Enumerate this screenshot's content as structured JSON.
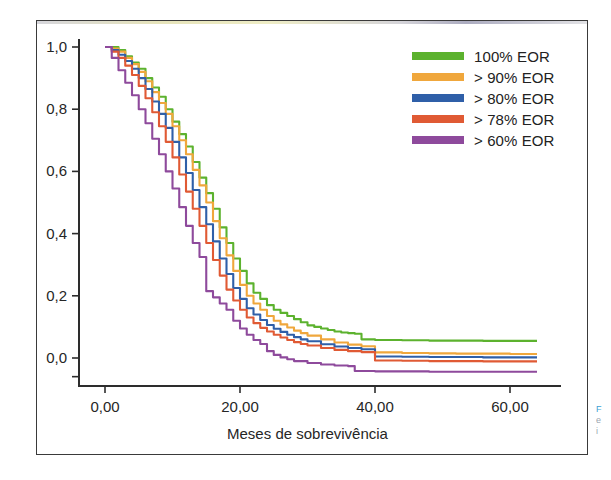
{
  "figure": {
    "background_color": "#ffffff",
    "frame_color": "#3a3a3a"
  },
  "legend": {
    "position": "top-right",
    "entries": [
      {
        "label": "100% EOR",
        "color": "#5cb22e"
      },
      {
        "label": "> 90% EOR",
        "color": "#f0a73c"
      },
      {
        "label": "> 80% EOR",
        "color": "#2f5fa8"
      },
      {
        "label": "> 78% EOR",
        "color": "#e05a34"
      },
      {
        "label": "> 60% EOR",
        "color": "#8e4a9c"
      }
    ]
  },
  "caption_fragment": {
    "line1": "F",
    "line2": "e",
    "line3": "i"
  },
  "chart_data": {
    "type": "line",
    "title": "",
    "subtitle": "",
    "xlabel": "Meses de sobrevivência",
    "ylabel": "",
    "xlim": [
      -4,
      68
    ],
    "ylim": [
      -0.09,
      1.06
    ],
    "grid": false,
    "legend_position": "top-right",
    "xticks": [
      0,
      20,
      40,
      60
    ],
    "xticklabels": [
      "0,00",
      "20,00",
      "40,00",
      "60,00"
    ],
    "yticks": [
      0.0,
      0.2,
      0.4,
      0.6,
      0.8,
      1.0
    ],
    "yticklabels": [
      "0,0",
      "0,2",
      "0,4",
      "0,6",
      "0,8",
      "1,0"
    ],
    "series": [
      {
        "name": "100% EOR",
        "color": "#5cb22e",
        "x": [
          0,
          1,
          2,
          3,
          4,
          5,
          6,
          7,
          8,
          9,
          10,
          11,
          12,
          13,
          14,
          15,
          16,
          17,
          18,
          19,
          20,
          21,
          22,
          23,
          24,
          25,
          26,
          27,
          28,
          29,
          30,
          31,
          32,
          33,
          34,
          35,
          36,
          37,
          38,
          40,
          44,
          48,
          52,
          56,
          60,
          64
        ],
        "values": [
          1.0,
          1.0,
          0.99,
          0.97,
          0.95,
          0.93,
          0.9,
          0.87,
          0.84,
          0.8,
          0.76,
          0.72,
          0.68,
          0.63,
          0.58,
          0.53,
          0.48,
          0.42,
          0.37,
          0.32,
          0.28,
          0.24,
          0.21,
          0.19,
          0.17,
          0.155,
          0.145,
          0.135,
          0.125,
          0.115,
          0.105,
          0.1,
          0.095,
          0.09,
          0.085,
          0.082,
          0.08,
          0.078,
          0.06,
          0.058,
          0.057,
          0.056,
          0.056,
          0.055,
          0.055,
          0.055
        ]
      },
      {
        "name": "> 90% EOR",
        "color": "#f0a73c",
        "x": [
          0,
          1,
          2,
          3,
          4,
          5,
          6,
          7,
          8,
          9,
          10,
          11,
          12,
          13,
          14,
          15,
          16,
          17,
          18,
          19,
          20,
          21,
          22,
          23,
          24,
          25,
          26,
          27,
          28,
          29,
          30,
          32,
          34,
          36,
          38,
          40,
          44,
          48,
          52,
          56,
          60,
          64
        ],
        "values": [
          1.0,
          0.995,
          0.985,
          0.965,
          0.945,
          0.92,
          0.89,
          0.855,
          0.82,
          0.785,
          0.745,
          0.7,
          0.655,
          0.605,
          0.555,
          0.5,
          0.44,
          0.385,
          0.33,
          0.28,
          0.235,
          0.2,
          0.175,
          0.155,
          0.135,
          0.12,
          0.108,
          0.098,
          0.088,
          0.08,
          0.072,
          0.06,
          0.05,
          0.043,
          0.038,
          0.018,
          0.016,
          0.015,
          0.014,
          0.014,
          0.013,
          0.013
        ]
      },
      {
        "name": "> 80% EOR",
        "color": "#2f5fa8",
        "x": [
          0,
          1,
          2,
          3,
          4,
          5,
          6,
          7,
          8,
          9,
          10,
          11,
          12,
          13,
          14,
          15,
          16,
          17,
          18,
          19,
          20,
          21,
          22,
          23,
          24,
          25,
          26,
          27,
          28,
          29,
          30,
          32,
          34,
          36,
          38,
          40,
          44,
          48,
          52,
          56,
          60,
          64
        ],
        "values": [
          1.0,
          0.99,
          0.975,
          0.955,
          0.93,
          0.9,
          0.865,
          0.825,
          0.785,
          0.74,
          0.695,
          0.645,
          0.595,
          0.54,
          0.485,
          0.43,
          0.375,
          0.32,
          0.27,
          0.225,
          0.19,
          0.16,
          0.14,
          0.122,
          0.106,
          0.094,
          0.084,
          0.075,
          0.067,
          0.06,
          0.054,
          0.044,
          0.037,
          0.032,
          0.028,
          0.005,
          0.004,
          0.003,
          0.003,
          0.002,
          0.002,
          0.002
        ]
      },
      {
        "name": "> 78% EOR",
        "color": "#e05a34",
        "x": [
          0,
          1,
          2,
          3,
          4,
          5,
          6,
          7,
          8,
          9,
          10,
          11,
          12,
          13,
          14,
          15,
          16,
          17,
          18,
          19,
          20,
          21,
          22,
          23,
          24,
          25,
          26,
          27,
          28,
          29,
          30,
          32,
          34,
          36,
          38,
          40,
          44,
          48,
          52,
          56,
          60,
          64
        ],
        "values": [
          1.0,
          0.985,
          0.965,
          0.94,
          0.91,
          0.875,
          0.835,
          0.79,
          0.745,
          0.695,
          0.645,
          0.59,
          0.535,
          0.48,
          0.425,
          0.37,
          0.315,
          0.265,
          0.22,
          0.185,
          0.155,
          0.13,
          0.112,
          0.097,
          0.085,
          0.075,
          0.066,
          0.058,
          0.051,
          0.045,
          0.04,
          0.032,
          0.026,
          0.022,
          0.019,
          -0.008,
          -0.009,
          -0.01,
          -0.01,
          -0.011,
          -0.011,
          -0.011
        ]
      },
      {
        "name": "> 60% EOR",
        "color": "#8e4a9c",
        "x": [
          0,
          1,
          2,
          3,
          4,
          5,
          6,
          7,
          8,
          9,
          10,
          11,
          12,
          13,
          14,
          15,
          16,
          17,
          18,
          19,
          20,
          21,
          22,
          23,
          24,
          25,
          26,
          27,
          28,
          30,
          32,
          34,
          36,
          37,
          40,
          44,
          48,
          52,
          56,
          60,
          64
        ],
        "values": [
          1.0,
          0.965,
          0.925,
          0.885,
          0.845,
          0.8,
          0.755,
          0.705,
          0.655,
          0.6,
          0.545,
          0.485,
          0.425,
          0.37,
          0.325,
          0.215,
          0.195,
          0.175,
          0.155,
          0.12,
          0.095,
          0.075,
          0.058,
          0.045,
          0.022,
          0.01,
          0.002,
          -0.004,
          -0.01,
          -0.016,
          -0.021,
          -0.024,
          -0.026,
          -0.042,
          -0.043,
          -0.043,
          -0.044,
          -0.044,
          -0.044,
          -0.044,
          -0.044
        ]
      }
    ]
  }
}
